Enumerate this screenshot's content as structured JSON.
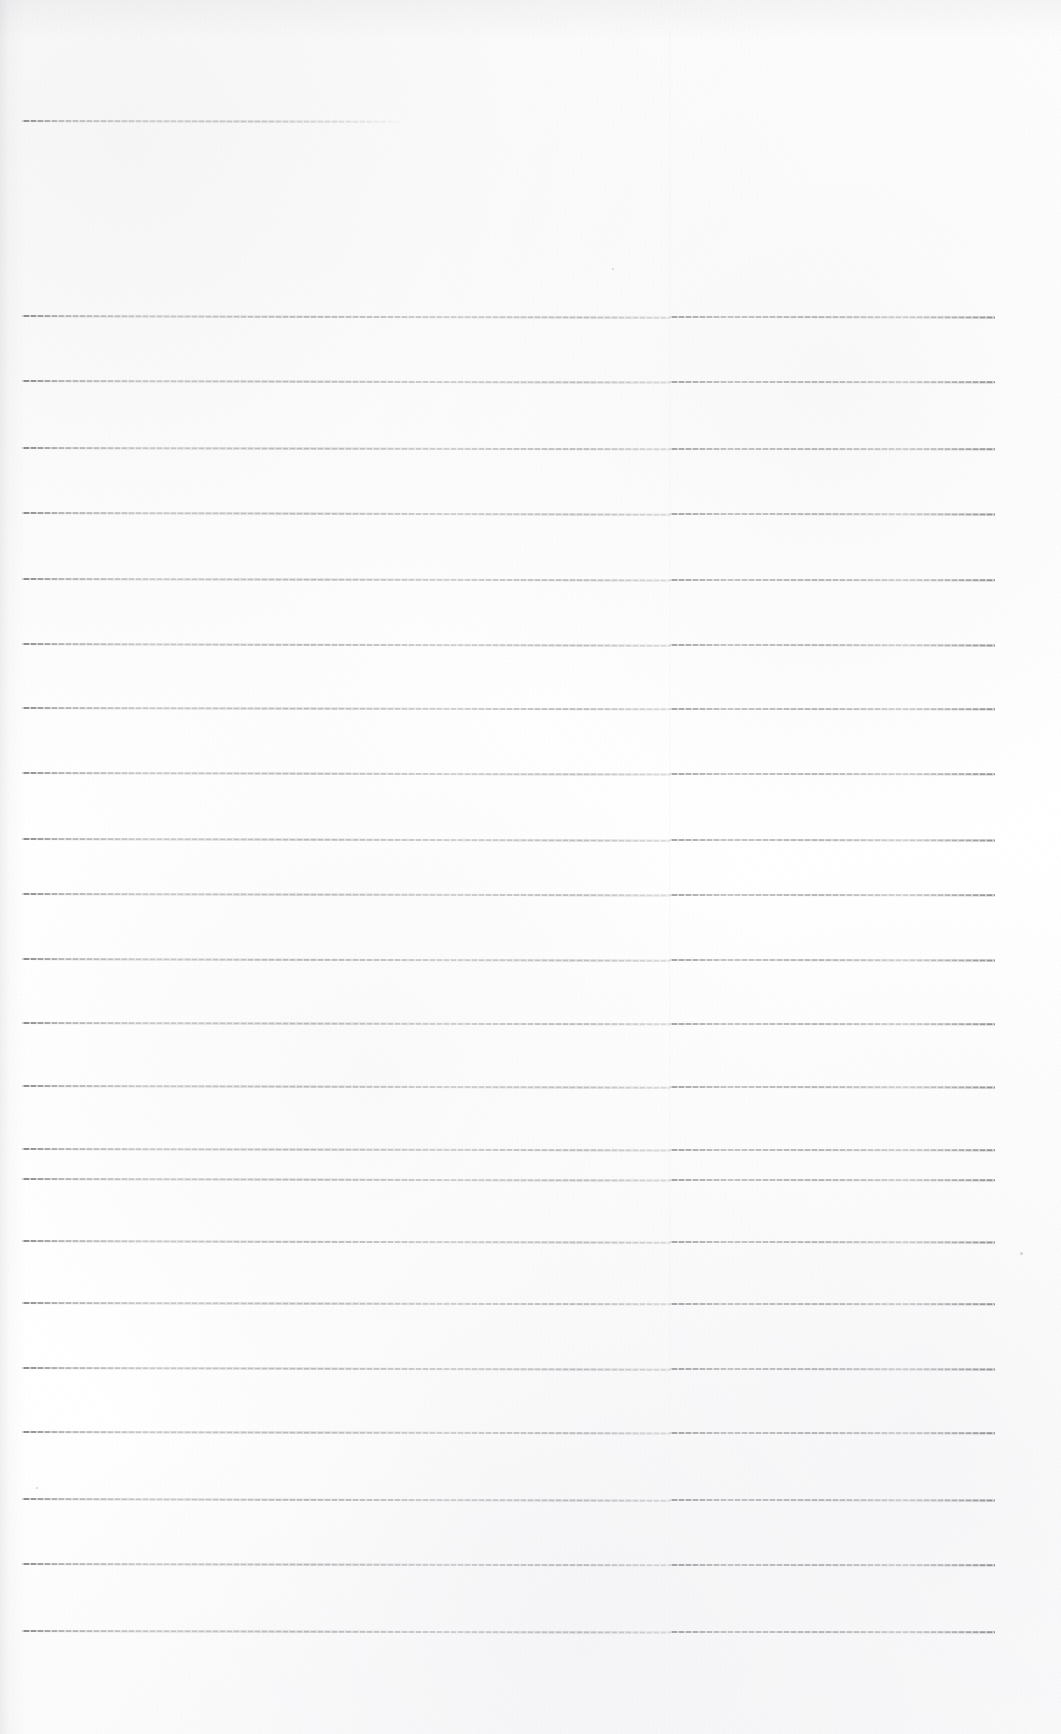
{
  "document": {
    "kind": "scanned-lined-paper",
    "description": "Blank ruled notebook page, scanned",
    "text_content": "",
    "page_width": 1061,
    "page_height": 1734,
    "paper_color": "#fdfdfd",
    "rule_color": "#8a8a8e",
    "has_handwriting": false,
    "has_printed_text": false
  },
  "layout": {
    "left_margin_x": 22,
    "right_margin_x": 995,
    "scan_seam_x": 670,
    "rule_spacing": 65,
    "first_rule_y": 315,
    "rule_thickness": 2
  },
  "rules": [
    {
      "id": "rule-top-partial",
      "y": 120,
      "x1": 22,
      "x2": 400,
      "partial": true,
      "tilt": 0.1
    },
    {
      "id": "rule-1",
      "y": 315,
      "x1": 22,
      "x2": 995,
      "partial": false,
      "tilt": 0.16
    },
    {
      "id": "rule-2",
      "y": 380,
      "x1": 22,
      "x2": 995,
      "partial": false,
      "tilt": 0.14
    },
    {
      "id": "rule-3",
      "y": 447,
      "x1": 22,
      "x2": 995,
      "partial": false,
      "tilt": 0.12
    },
    {
      "id": "rule-4",
      "y": 512,
      "x1": 22,
      "x2": 995,
      "partial": false,
      "tilt": 0.15
    },
    {
      "id": "rule-5",
      "y": 578,
      "x1": 22,
      "x2": 995,
      "partial": false,
      "tilt": 0.13
    },
    {
      "id": "rule-6",
      "y": 643,
      "x1": 22,
      "x2": 995,
      "partial": false,
      "tilt": 0.16
    },
    {
      "id": "rule-7",
      "y": 707,
      "x1": 22,
      "x2": 995,
      "partial": false,
      "tilt": 0.12
    },
    {
      "id": "rule-8",
      "y": 772,
      "x1": 22,
      "x2": 995,
      "partial": false,
      "tilt": 0.14
    },
    {
      "id": "rule-9",
      "y": 838,
      "x1": 22,
      "x2": 995,
      "partial": false,
      "tilt": 0.15
    },
    {
      "id": "rule-10",
      "y": 893,
      "x1": 22,
      "x2": 995,
      "partial": false,
      "tilt": 0.13
    },
    {
      "id": "rule-11",
      "y": 958,
      "x1": 22,
      "x2": 995,
      "partial": false,
      "tilt": 0.16
    },
    {
      "id": "rule-12",
      "y": 1022,
      "x1": 22,
      "x2": 995,
      "partial": false,
      "tilt": 0.12
    },
    {
      "id": "rule-13",
      "y": 1085,
      "x1": 22,
      "x2": 995,
      "partial": false,
      "tilt": 0.15
    },
    {
      "id": "rule-14",
      "y": 1148,
      "x1": 22,
      "x2": 995,
      "partial": false,
      "tilt": 0.13
    },
    {
      "id": "rule-15",
      "y": 1178,
      "x1": 22,
      "x2": 995,
      "partial": false,
      "tilt": 0.14
    },
    {
      "id": "rule-16",
      "y": 1240,
      "x1": 22,
      "x2": 995,
      "partial": false,
      "tilt": 0.16
    },
    {
      "id": "rule-17",
      "y": 1302,
      "x1": 22,
      "x2": 995,
      "partial": false,
      "tilt": 0.12
    },
    {
      "id": "rule-18",
      "y": 1367,
      "x1": 22,
      "x2": 995,
      "partial": false,
      "tilt": 0.15
    },
    {
      "id": "rule-19",
      "y": 1431,
      "x1": 22,
      "x2": 995,
      "partial": false,
      "tilt": 0.13
    },
    {
      "id": "rule-20",
      "y": 1498,
      "x1": 22,
      "x2": 995,
      "partial": false,
      "tilt": 0.16
    },
    {
      "id": "rule-21",
      "y": 1563,
      "x1": 22,
      "x2": 995,
      "partial": false,
      "tilt": 0.12
    },
    {
      "id": "rule-22",
      "y": 1630,
      "x1": 22,
      "x2": 995,
      "partial": false,
      "tilt": 0.14
    }
  ],
  "specks": [
    {
      "x": 1020,
      "y": 1252,
      "size": 3
    },
    {
      "x": 36,
      "y": 1487,
      "size": 2
    },
    {
      "x": 612,
      "y": 268,
      "size": 2
    }
  ]
}
